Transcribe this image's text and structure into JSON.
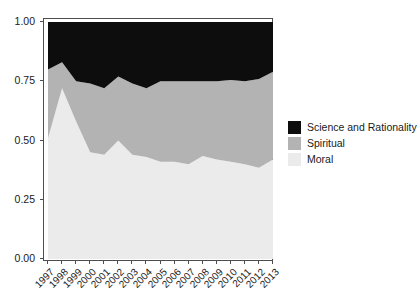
{
  "chart_data": {
    "type": "area",
    "title": "",
    "subtitle": "",
    "xlabel": "",
    "ylabel": "",
    "stacked": true,
    "normalized": true,
    "grid": false,
    "legend_position": "right",
    "xlim": [
      1997,
      2013
    ],
    "ylim": [
      0.0,
      1.0
    ],
    "x": [
      1997,
      1998,
      1999,
      2000,
      2001,
      2002,
      2003,
      2004,
      2005,
      2006,
      2007,
      2008,
      2009,
      2010,
      2011,
      2012,
      2013
    ],
    "categories": [
      "1997",
      "1998",
      "1999",
      "2000",
      "2001",
      "2002",
      "2003",
      "2004",
      "2005",
      "2006",
      "2007",
      "2008",
      "2009",
      "2010",
      "2011",
      "2012",
      "2013"
    ],
    "ytick_labels": [
      "0.00",
      "0.25",
      "0.50",
      "0.75",
      "1.00"
    ],
    "ytick_values": [
      0.0,
      0.25,
      0.5,
      0.75,
      1.0
    ],
    "series": [
      {
        "name": "Moral",
        "color": "#ebebeb",
        "values": [
          0.51,
          0.72,
          0.58,
          0.45,
          0.44,
          0.5,
          0.44,
          0.43,
          0.41,
          0.41,
          0.4,
          0.435,
          0.42,
          0.41,
          0.4,
          0.385,
          0.42
        ]
      },
      {
        "name": "Spiritual",
        "color": "#b3b3b3",
        "values": [
          0.29,
          0.11,
          0.17,
          0.29,
          0.28,
          0.27,
          0.3,
          0.29,
          0.34,
          0.34,
          0.35,
          0.315,
          0.33,
          0.345,
          0.35,
          0.375,
          0.37
        ]
      },
      {
        "name": "Science and Rationality",
        "color": "#0d0d0d",
        "values": [
          0.2,
          0.17,
          0.25,
          0.26,
          0.28,
          0.23,
          0.26,
          0.28,
          0.25,
          0.25,
          0.25,
          0.25,
          0.25,
          0.245,
          0.25,
          0.24,
          0.21
        ]
      }
    ],
    "cumulative_upper_moral": [
      0.51,
      0.72,
      0.58,
      0.45,
      0.44,
      0.5,
      0.44,
      0.43,
      0.41,
      0.41,
      0.4,
      0.435,
      0.42,
      0.41,
      0.4,
      0.385,
      0.42
    ],
    "cumulative_upper_spiritual": [
      0.8,
      0.83,
      0.75,
      0.74,
      0.72,
      0.77,
      0.74,
      0.72,
      0.75,
      0.75,
      0.75,
      0.75,
      0.75,
      0.755,
      0.75,
      0.76,
      0.79
    ]
  },
  "legend": {
    "items": [
      {
        "label": "Science and Rationality",
        "color": "#0d0d0d"
      },
      {
        "label": "Spiritual",
        "color": "#b3b3b3"
      },
      {
        "label": "Moral",
        "color": "#ebebeb"
      }
    ]
  },
  "axes": {
    "y_ticks": [
      "1.00",
      "0.75",
      "0.50",
      "0.25",
      "0.00"
    ],
    "x_ticks": [
      "1997",
      "1998",
      "1999",
      "2000",
      "2001",
      "2002",
      "2003",
      "2004",
      "2005",
      "2006",
      "2007",
      "2008",
      "2009",
      "2010",
      "2011",
      "2012",
      "2013"
    ]
  },
  "colors": {
    "panel_border": "#4d4d4d",
    "background": "#ffffff",
    "text": "#1a1a1a",
    "moral": "#ebebeb",
    "spiritual": "#b3b3b3",
    "science": "#0d0d0d"
  }
}
